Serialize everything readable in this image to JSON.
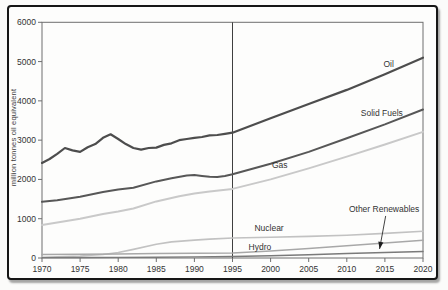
{
  "figure": {
    "background": "#fdfdfc",
    "frame_color": "#161616",
    "axis_color": "#6f6f6f",
    "reference_line_color": "#3f3f3f",
    "text_color": "#333333"
  },
  "chart_data": {
    "type": "line",
    "title": "",
    "xlabel": "",
    "ylabel": "million tonnes oil equivalent",
    "xlim": [
      1970,
      2020
    ],
    "ylim": [
      0,
      6000
    ],
    "x_ticks": [
      1970,
      1975,
      1980,
      1985,
      1990,
      1995,
      2000,
      2005,
      2010,
      2015,
      2020
    ],
    "y_ticks": [
      0,
      1000,
      2000,
      3000,
      4000,
      5000,
      6000
    ],
    "grid": "off",
    "legend_position": "inline-labels",
    "reference_line_x": 1995,
    "series": [
      {
        "name": "Oil",
        "color": "#4d4d4d",
        "stroke_width": 2.2,
        "label_anchor": {
          "year": 2015.5,
          "value": 4940
        },
        "points": [
          [
            1970,
            2420
          ],
          [
            1971,
            2520
          ],
          [
            1972,
            2650
          ],
          [
            1973,
            2800
          ],
          [
            1974,
            2740
          ],
          [
            1975,
            2700
          ],
          [
            1976,
            2820
          ],
          [
            1977,
            2900
          ],
          [
            1978,
            3060
          ],
          [
            1979,
            3150
          ],
          [
            1980,
            3030
          ],
          [
            1981,
            2900
          ],
          [
            1982,
            2800
          ],
          [
            1983,
            2760
          ],
          [
            1984,
            2800
          ],
          [
            1985,
            2810
          ],
          [
            1986,
            2880
          ],
          [
            1987,
            2920
          ],
          [
            1988,
            3000
          ],
          [
            1989,
            3030
          ],
          [
            1990,
            3060
          ],
          [
            1991,
            3080
          ],
          [
            1992,
            3120
          ],
          [
            1993,
            3130
          ],
          [
            1994,
            3160
          ],
          [
            1995,
            3190
          ],
          [
            2000,
            3560
          ],
          [
            2005,
            3920
          ],
          [
            2010,
            4280
          ],
          [
            2015,
            4680
          ],
          [
            2020,
            5100
          ]
        ]
      },
      {
        "name": "Solid Fuels",
        "color": "#575757",
        "stroke_width": 2.0,
        "label_anchor": {
          "year": 2014.6,
          "value": 3700
        },
        "points": [
          [
            1970,
            1430
          ],
          [
            1972,
            1470
          ],
          [
            1975,
            1560
          ],
          [
            1978,
            1680
          ],
          [
            1980,
            1740
          ],
          [
            1982,
            1790
          ],
          [
            1985,
            1950
          ],
          [
            1987,
            2030
          ],
          [
            1989,
            2100
          ],
          [
            1990,
            2110
          ],
          [
            1991,
            2090
          ],
          [
            1992,
            2070
          ],
          [
            1993,
            2060
          ],
          [
            1994,
            2090
          ],
          [
            1995,
            2130
          ],
          [
            2000,
            2400
          ],
          [
            2005,
            2700
          ],
          [
            2010,
            3050
          ],
          [
            2015,
            3400
          ],
          [
            2020,
            3780
          ]
        ]
      },
      {
        "name": "Gas",
        "color": "#c9c9c9",
        "stroke_width": 2.0,
        "label_anchor": {
          "year": 2001.2,
          "value": 2370
        },
        "points": [
          [
            1970,
            840
          ],
          [
            1975,
            1000
          ],
          [
            1978,
            1120
          ],
          [
            1980,
            1180
          ],
          [
            1982,
            1260
          ],
          [
            1985,
            1440
          ],
          [
            1988,
            1570
          ],
          [
            1990,
            1640
          ],
          [
            1992,
            1690
          ],
          [
            1995,
            1760
          ],
          [
            2000,
            2000
          ],
          [
            2005,
            2280
          ],
          [
            2010,
            2580
          ],
          [
            2015,
            2890
          ],
          [
            2020,
            3210
          ]
        ]
      },
      {
        "name": "Nuclear",
        "color": "#c2c2c2",
        "stroke_width": 1.6,
        "label_anchor": {
          "year": 1999.8,
          "value": 760
        },
        "points": [
          [
            1970,
            20
          ],
          [
            1975,
            50
          ],
          [
            1978,
            90
          ],
          [
            1980,
            140
          ],
          [
            1982,
            220
          ],
          [
            1985,
            350
          ],
          [
            1987,
            410
          ],
          [
            1990,
            455
          ],
          [
            1992,
            480
          ],
          [
            1995,
            510
          ],
          [
            2000,
            530
          ],
          [
            2005,
            550
          ],
          [
            2010,
            580
          ],
          [
            2015,
            625
          ],
          [
            2020,
            680
          ]
        ]
      },
      {
        "name": "Hydro",
        "color": "#a8a8a8",
        "stroke_width": 1.5,
        "label_anchor": {
          "year": 1998.6,
          "value": 280
        },
        "points": [
          [
            1970,
            90
          ],
          [
            1975,
            98
          ],
          [
            1980,
            105
          ],
          [
            1985,
            115
          ],
          [
            1990,
            122
          ],
          [
            1995,
            130
          ],
          [
            2000,
            175
          ],
          [
            2005,
            240
          ],
          [
            2010,
            310
          ],
          [
            2015,
            380
          ],
          [
            2020,
            450
          ]
        ]
      },
      {
        "name": "Other Renewables",
        "color": "#7a7a7a",
        "stroke_width": 1.4,
        "label_anchor": {
          "year": 2014.9,
          "value": 1250
        },
        "points": [
          [
            1970,
            10
          ],
          [
            1975,
            12
          ],
          [
            1980,
            15
          ],
          [
            1985,
            20
          ],
          [
            1990,
            28
          ],
          [
            1995,
            38
          ],
          [
            2000,
            55
          ],
          [
            2005,
            85
          ],
          [
            2010,
            115
          ],
          [
            2015,
            140
          ],
          [
            2020,
            165
          ]
        ]
      }
    ],
    "annotation_arrow": {
      "for_series": "Other Renewables",
      "from": {
        "year": 2015.1,
        "value": 1070
      },
      "to": {
        "year": 2014.3,
        "value": 230
      }
    }
  }
}
